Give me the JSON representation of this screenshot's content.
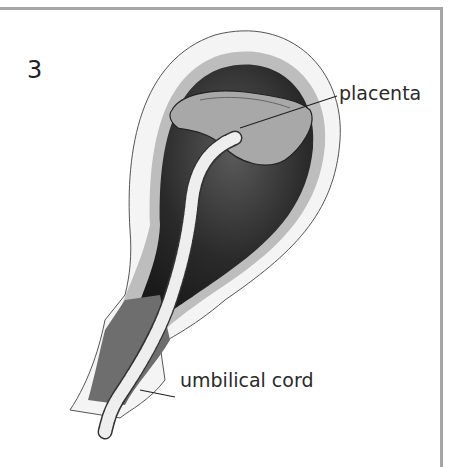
{
  "figure": {
    "stage_number": "3",
    "labels": {
      "placenta": "placenta",
      "umbilical_cord": "umbilical cord"
    },
    "colors": {
      "frame": "#a6a6a6",
      "outer_membrane": "#f2f2f2",
      "middle_layer": "#bdbdbd",
      "inner_cavity": "#2b2b2b",
      "placenta": "#9e9e9e",
      "cord": "#e8e8e8"
    }
  }
}
